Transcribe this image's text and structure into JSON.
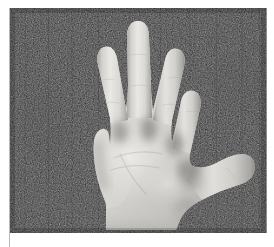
{
  "figure": {
    "kind": "photograph",
    "orientation": "palm-facing-viewer",
    "color_mode": "grayscale",
    "caption": "",
    "plate": {
      "x": 10,
      "y": 8,
      "width": 256,
      "height": 225
    },
    "colors": {
      "background": "#1b1b1b",
      "background_noise_dark": "#0e0e0e",
      "background_noise_light": "#2a2a2a",
      "skin_highlight": "#eceae6",
      "skin_base": "#d8d6d2",
      "skin_midtone": "#c3c1bd",
      "skin_shadow": "#9e9c99",
      "skin_deep_shadow": "#7c7a77",
      "page": "#ffffff",
      "rule": "#b9b9b9",
      "plate_edge": "#8f8f8f"
    },
    "anatomy": {
      "digits": [
        {
          "name": "index-finger",
          "tip_x": 168,
          "tip_y": 48,
          "label": "index"
        },
        {
          "name": "middle-finger",
          "tip_x": 131,
          "tip_y": 26,
          "label": "middle"
        },
        {
          "name": "ring-finger",
          "tip_x": 96,
          "tip_y": 43,
          "label": "ring"
        },
        {
          "name": "little-finger",
          "tip_x": 185,
          "tip_y": 55,
          "label": "little"
        },
        {
          "name": "thumb",
          "tip_x": 240,
          "tip_y": 170,
          "label": "thumb"
        }
      ],
      "digit_count": 5,
      "extended_finger_count": 4,
      "palm_center_x": 138,
      "palm_center_y": 168,
      "wrist_left_x": 104,
      "wrist_right_x": 166,
      "wrist_y": 233
    }
  }
}
